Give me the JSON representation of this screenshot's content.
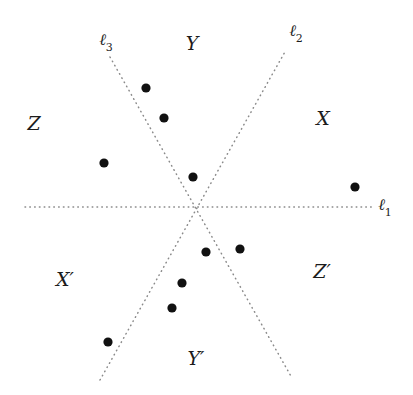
{
  "figure": {
    "width": 413,
    "height": 395,
    "background_color": "#ffffff",
    "dot_color": "#111111",
    "line_color": "#8a8a8a"
  },
  "chart_data": {
    "type": "scatter",
    "title": "",
    "xlabel": "",
    "ylabel": "",
    "xlim": [
      0,
      413
    ],
    "ylim": [
      0,
      395
    ],
    "grid": false,
    "legend": "none",
    "note": "Pixel coordinates, origin at top-left of the 413x395 image.",
    "intersection_point": {
      "x": 193,
      "y": 207
    },
    "lines": [
      {
        "name": "l1",
        "label": "ℓ",
        "subscript": "1",
        "label_x": 385,
        "label_y": 207,
        "style": "dotted",
        "x1": 25,
        "y1": 207,
        "x2": 372,
        "y2": 207,
        "orientation": "horizontal"
      },
      {
        "name": "l2",
        "label": "ℓ",
        "subscript": "2",
        "label_x": 296,
        "label_y": 33,
        "style": "dotted",
        "x1": 100,
        "y1": 380,
        "x2": 286,
        "y2": 50,
        "orientation": "rising-right"
      },
      {
        "name": "l3",
        "label": "ℓ",
        "subscript": "3",
        "label_x": 106,
        "label_y": 42,
        "style": "dotted",
        "x1": 110,
        "y1": 57,
        "x2": 292,
        "y2": 378,
        "orientation": "falling-right"
      }
    ],
    "regions": [
      {
        "name": "Y",
        "label": "Y",
        "x": 192,
        "y": 43,
        "prime": false
      },
      {
        "name": "Z",
        "label": "Z",
        "x": 34,
        "y": 123,
        "prime": false
      },
      {
        "name": "X",
        "label": "X",
        "x": 323,
        "y": 118,
        "prime": false
      },
      {
        "name": "Xp",
        "label": "X′",
        "x": 65,
        "y": 279,
        "prime": true
      },
      {
        "name": "Zp",
        "label": "Z′",
        "x": 322,
        "y": 271,
        "prime": true
      },
      {
        "name": "Yp",
        "label": "Y′",
        "x": 196,
        "y": 358,
        "prime": true
      }
    ],
    "points": [
      {
        "id": "p1",
        "x": 146,
        "y": 88,
        "region": "Y"
      },
      {
        "id": "p2",
        "x": 164,
        "y": 118,
        "region": "Y"
      },
      {
        "id": "p3",
        "x": 104,
        "y": 163,
        "region": "Z"
      },
      {
        "id": "p4",
        "x": 193,
        "y": 177,
        "region": "Y"
      },
      {
        "id": "p5",
        "x": 355,
        "y": 187,
        "region": "X"
      },
      {
        "id": "p6",
        "x": 206,
        "y": 252,
        "region": "Yp"
      },
      {
        "id": "p7",
        "x": 240,
        "y": 249,
        "region": "Zp"
      },
      {
        "id": "p8",
        "x": 182,
        "y": 283,
        "region": "Yp"
      },
      {
        "id": "p9",
        "x": 172,
        "y": 308,
        "region": "Yp"
      },
      {
        "id": "p10",
        "x": 108,
        "y": 342,
        "region": "Xp"
      }
    ],
    "point_radius": 4.6,
    "point_count": 10
  }
}
